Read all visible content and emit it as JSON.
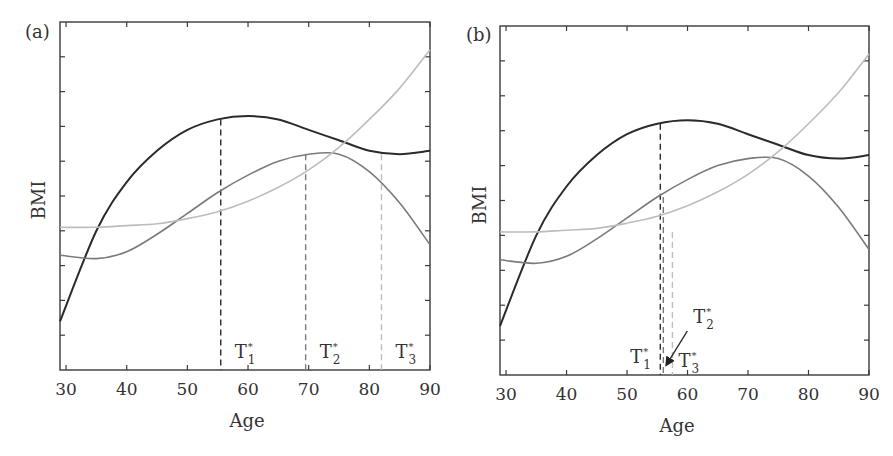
{
  "chart_data": [
    {
      "type": "line",
      "panel_label": "(a)",
      "title": "",
      "xlabel": "Age",
      "ylabel": "BMI",
      "xlim": [
        29,
        90
      ],
      "ylim": [
        0,
        10
      ],
      "xticks": [
        30,
        40,
        50,
        60,
        70,
        80,
        90
      ],
      "yticks_count": 10,
      "ytick_labels": [],
      "grid": false,
      "legend": null,
      "x": [
        29,
        35,
        40,
        45,
        50,
        55,
        60,
        65,
        70,
        75,
        80,
        85,
        90
      ],
      "series": [
        {
          "name": "Trajectory 1 (dark)",
          "color": "#2b2b2b",
          "values": [
            1.4,
            4.0,
            5.4,
            6.3,
            6.9,
            7.2,
            7.3,
            7.2,
            6.9,
            6.6,
            6.3,
            6.2,
            6.3
          ]
        },
        {
          "name": "Trajectory 2 (medium gray)",
          "color": "#7a7a7a",
          "values": [
            3.3,
            3.2,
            3.4,
            3.9,
            4.5,
            5.1,
            5.6,
            6.0,
            6.2,
            6.2,
            5.7,
            4.8,
            3.6
          ]
        },
        {
          "name": "Trajectory 3 (light gray)",
          "color": "#bdbdbd",
          "values": [
            4.1,
            4.1,
            4.15,
            4.2,
            4.35,
            4.55,
            4.85,
            5.25,
            5.75,
            6.4,
            7.2,
            8.1,
            9.2
          ]
        }
      ],
      "annotations": [
        {
          "label": "T",
          "subscript": "1",
          "superscript": "*",
          "x": 55.5,
          "line_color": "#2b2b2b",
          "top_value": 7.2
        },
        {
          "label": "T",
          "subscript": "2",
          "superscript": "*",
          "x": 69.5,
          "line_color": "#7a7a7a",
          "top_value": 6.2
        },
        {
          "label": "T",
          "subscript": "3",
          "superscript": "*",
          "x": 82.0,
          "line_color": "#bdbdbd",
          "top_value": 6.2
        }
      ]
    },
    {
      "type": "line",
      "panel_label": "(b)",
      "title": "",
      "xlabel": "Age",
      "ylabel": "BMI",
      "xlim": [
        29,
        90
      ],
      "ylim": [
        0,
        10
      ],
      "xticks": [
        30,
        40,
        50,
        60,
        70,
        80,
        90
      ],
      "yticks_count": 10,
      "ytick_labels": [],
      "grid": false,
      "legend": null,
      "x": [
        29,
        35,
        40,
        45,
        50,
        55,
        60,
        65,
        70,
        75,
        80,
        85,
        90
      ],
      "series": [
        {
          "name": "Trajectory 1 (dark)",
          "color": "#2b2b2b",
          "values": [
            1.4,
            4.0,
            5.4,
            6.3,
            6.9,
            7.2,
            7.3,
            7.2,
            6.9,
            6.6,
            6.3,
            6.2,
            6.3
          ]
        },
        {
          "name": "Trajectory 2 (medium gray)",
          "color": "#7a7a7a",
          "values": [
            3.3,
            3.2,
            3.4,
            3.9,
            4.5,
            5.1,
            5.6,
            6.0,
            6.2,
            6.2,
            5.7,
            4.8,
            3.6
          ]
        },
        {
          "name": "Trajectory 3 (light gray)",
          "color": "#bdbdbd",
          "values": [
            4.1,
            4.1,
            4.15,
            4.2,
            4.35,
            4.55,
            4.85,
            5.25,
            5.75,
            6.4,
            7.2,
            8.1,
            9.2
          ]
        }
      ],
      "annotations": [
        {
          "label": "T",
          "subscript": "1",
          "superscript": "*",
          "x": 55.5,
          "line_color": "#2b2b2b",
          "top_value": 7.2
        },
        {
          "label": "T",
          "subscript": "2",
          "superscript": "*",
          "x": 56.0,
          "line_color": "#7a7a7a",
          "top_value": 5.1,
          "arrow": true
        },
        {
          "label": "T",
          "subscript": "3",
          "superscript": "*",
          "x": 57.5,
          "line_color": "#bdbdbd",
          "top_value": 4.1
        }
      ]
    }
  ]
}
